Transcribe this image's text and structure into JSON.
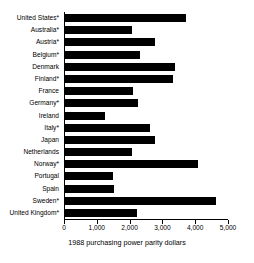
{
  "chart_data": {
    "type": "bar",
    "orientation": "horizontal",
    "title": "",
    "xlabel": "1988 purchasing power parity dollars",
    "ylabel": "",
    "xlim": [
      0,
      5000
    ],
    "grid": false,
    "legend": null,
    "xticks": [
      0,
      1000,
      2000,
      3000,
      4000,
      5000
    ],
    "xtick_labels": [
      "0",
      "1,000",
      "2,000",
      "3,000",
      "4,000",
      "5,000"
    ],
    "bar_color": "#000000",
    "categories": [
      "United States*",
      "Australia*",
      "Austria*",
      "Belgium*",
      "Denmark",
      "Finland*",
      "France",
      "Germany*",
      "Ireland",
      "Italy*",
      "Japan",
      "Netherlands",
      "Norway*",
      "Portugal",
      "Spain",
      "Sweden*",
      "United Kingdom*"
    ],
    "values": [
      3700,
      2030,
      2730,
      2280,
      3350,
      3290,
      2070,
      2230,
      1210,
      2580,
      2730,
      2040,
      4070,
      1460,
      1500,
      4610,
      2210
    ],
    "annotations": [
      "* denotes country marked with asterisk in axis labels"
    ]
  }
}
